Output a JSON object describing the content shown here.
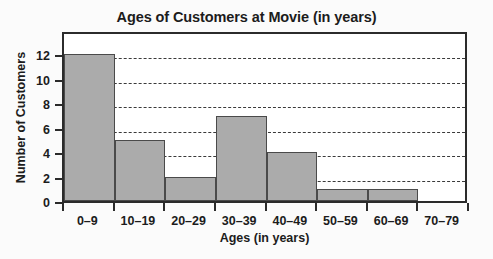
{
  "chart_data": {
    "type": "bar",
    "title": "Ages of Customers at Movie (in years)",
    "xlabel": "Ages (in years)",
    "ylabel": "Number of Customers",
    "categories": [
      "0–9",
      "10–19",
      "20–29",
      "30–39",
      "40–49",
      "50–59",
      "60–69",
      "70–79"
    ],
    "values": [
      12,
      5,
      2,
      7,
      4,
      1,
      1,
      0
    ],
    "ylim": [
      0,
      14
    ],
    "yticks": [
      0,
      2,
      4,
      6,
      8,
      10,
      12
    ],
    "ytick_labels": [
      "0",
      "2",
      "4",
      "6",
      "8",
      "10",
      "12"
    ],
    "grid": true,
    "grid_axis": "y",
    "legend": false,
    "bar_color": "#ababab",
    "bar_edge_color": "#4a4a4a",
    "frame_color": "#2b2b2b",
    "gridline_color": "#3a3a3a",
    "background_color": "#fafafa",
    "plot_background_color": "#ffffff",
    "text_color": "#1c1c1c"
  }
}
